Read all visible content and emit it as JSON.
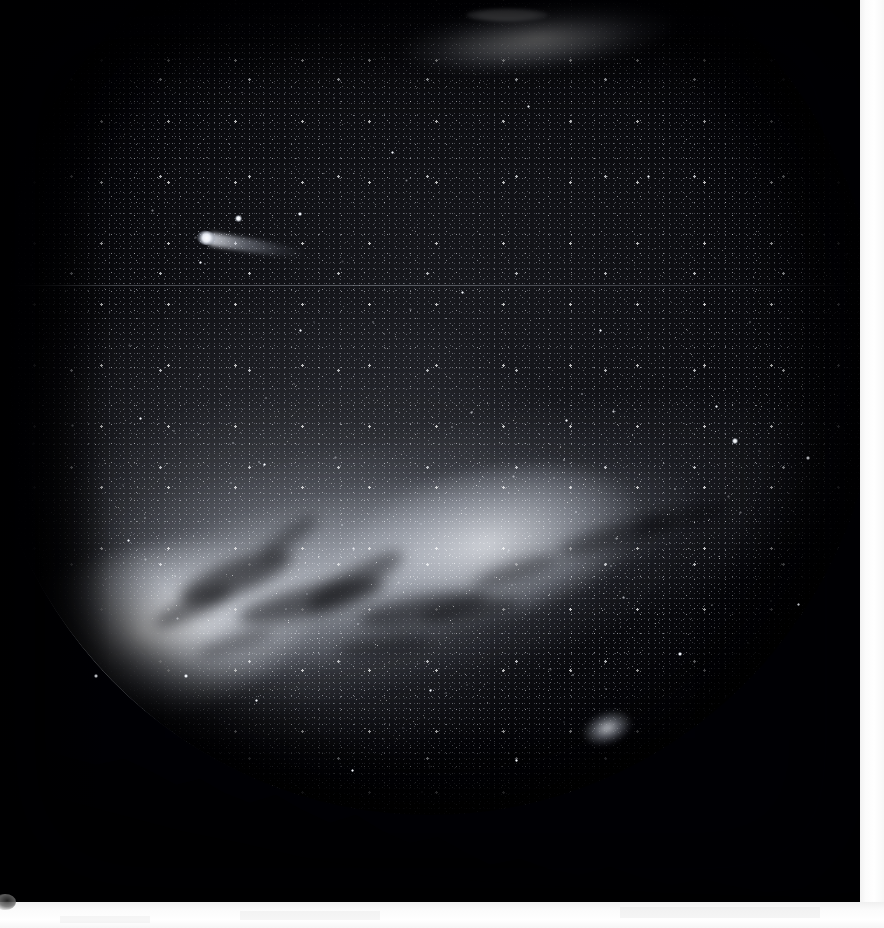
{
  "image": {
    "kind": "all-sky-fisheye-astrophotograph",
    "medium": "photographic print",
    "title": "",
    "caption": "",
    "background_color": "#000005",
    "paper_color": "#fdfdfd",
    "width_px": 884,
    "height_px": 928
  },
  "plate": {
    "emulsion_width_px": 860,
    "emulsion_height_px": 903,
    "right_margin_width_px": 24,
    "bottom_margin_height_px": 26,
    "margin_scribble_text": "",
    "corner_blob_label": ""
  },
  "sky": {
    "dome_label": "",
    "star_field_label": "",
    "milky_way_label": "",
    "milky_way_halo_label": "",
    "dust_lane_label": "",
    "horizon_label": ""
  },
  "objects": [
    {
      "name": "comet",
      "label": "",
      "x": 196,
      "y": 232,
      "brightness": "bright"
    },
    {
      "name": "large-magellanic-cloud",
      "label": "",
      "x": 578,
      "y": 706,
      "brightness": "faint"
    },
    {
      "name": "horizon-glow",
      "label": "",
      "x": 400,
      "y": 0,
      "brightness": "very-bright"
    }
  ],
  "dust_lanes": [
    {
      "x": 176,
      "y": 560,
      "w": 120,
      "h": 34,
      "rot": -22,
      "opacity": 0.7
    },
    {
      "x": 236,
      "y": 586,
      "w": 150,
      "h": 30,
      "rot": -14,
      "opacity": 0.66
    },
    {
      "x": 300,
      "y": 568,
      "w": 110,
      "h": 26,
      "rot": -30,
      "opacity": 0.58
    },
    {
      "x": 358,
      "y": 596,
      "w": 132,
      "h": 26,
      "rot": -10,
      "opacity": 0.6
    },
    {
      "x": 420,
      "y": 600,
      "w": 100,
      "h": 22,
      "rot": -8,
      "opacity": 0.55
    },
    {
      "x": 150,
      "y": 596,
      "w": 86,
      "h": 22,
      "rot": -26,
      "opacity": 0.62
    },
    {
      "x": 470,
      "y": 562,
      "w": 92,
      "h": 20,
      "rot": -18,
      "opacity": 0.48
    },
    {
      "x": 556,
      "y": 524,
      "w": 120,
      "h": 24,
      "rot": -16,
      "opacity": 0.52
    },
    {
      "x": 636,
      "y": 508,
      "w": 96,
      "h": 20,
      "rot": -14,
      "opacity": 0.44
    },
    {
      "x": 254,
      "y": 528,
      "w": 70,
      "h": 18,
      "rot": -36,
      "opacity": 0.5
    },
    {
      "x": 336,
      "y": 636,
      "w": 96,
      "h": 20,
      "rot": -6,
      "opacity": 0.45
    },
    {
      "x": 196,
      "y": 634,
      "w": 80,
      "h": 18,
      "rot": -18,
      "opacity": 0.46
    }
  ],
  "bright_stars": [
    {
      "x": 238,
      "y": 218,
      "size": 7
    },
    {
      "x": 300,
      "y": 214,
      "size": 4
    },
    {
      "x": 200,
      "y": 262,
      "size": 3
    },
    {
      "x": 735,
      "y": 441,
      "size": 6
    },
    {
      "x": 716,
      "y": 406,
      "size": 3
    },
    {
      "x": 808,
      "y": 458,
      "size": 4
    },
    {
      "x": 528,
      "y": 106,
      "size": 3
    },
    {
      "x": 392,
      "y": 152,
      "size": 3
    },
    {
      "x": 648,
      "y": 176,
      "size": 3
    },
    {
      "x": 140,
      "y": 418,
      "size": 3
    },
    {
      "x": 96,
      "y": 676,
      "size": 4
    },
    {
      "x": 186,
      "y": 676,
      "size": 4
    },
    {
      "x": 256,
      "y": 700,
      "size": 3
    },
    {
      "x": 430,
      "y": 690,
      "size": 3
    },
    {
      "x": 680,
      "y": 654,
      "size": 4
    },
    {
      "x": 798,
      "y": 604,
      "size": 3
    },
    {
      "x": 300,
      "y": 330,
      "size": 3
    },
    {
      "x": 462,
      "y": 292,
      "size": 3
    },
    {
      "x": 600,
      "y": 330,
      "size": 3
    },
    {
      "x": 128,
      "y": 540,
      "size": 3
    },
    {
      "x": 352,
      "y": 770,
      "size": 3
    },
    {
      "x": 516,
      "y": 760,
      "size": 3
    },
    {
      "x": 264,
      "y": 464,
      "size": 3
    },
    {
      "x": 566,
      "y": 420,
      "size": 3
    }
  ],
  "defects": {
    "crease_line_label": "",
    "crease_y_px": 285,
    "vignette_label": ""
  }
}
